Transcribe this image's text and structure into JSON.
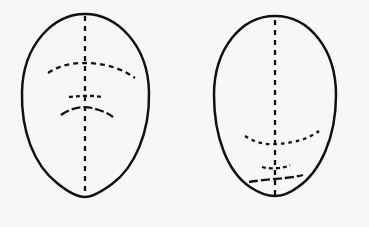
{
  "image": {
    "title": "Two head outlines with dashed facial proportion guidelines",
    "background_color": "#f7f7f6",
    "ink_color": "#111111",
    "width": 369,
    "height": 227
  },
  "figures": [
    {
      "id": "left-head",
      "label": "Left head outline",
      "description": "Egg-shaped head, wider at the cranium and tapering to a narrow rounded chin, with dashed vertical centerline and dashed brow, nose and mouth guidelines placed high on the face",
      "outline": {
        "center_x": 85,
        "center_y": 105,
        "left_x": 21,
        "right_x": 150,
        "top_y": 14,
        "bottom_y": 197,
        "path": "M 85 14 C 116 14 148 44 149 92 C 150 133 134 168 112 184 C 101 192 92 197 85 197 C 78 197 68 192 57 183 C 34 165 21 131 22 92 C 23 44 54 14 85 14 Z"
      },
      "guides": [
        {
          "name": "midline",
          "type": "vertical-centerline",
          "path": "M 85 16 L 85 196",
          "dash": "5 5"
        },
        {
          "name": "brow-line",
          "type": "brow-arc",
          "path": "M 48 73 C 62 64 74 63 85 63 C 100 63 118 66 135 78",
          "dash": "5 4"
        },
        {
          "name": "nose-line",
          "type": "nose-bar",
          "path": "M 69 97 C 76 96 94 95 101 97",
          "dash": "4 3"
        },
        {
          "name": "mouth-line",
          "type": "mouth-arc",
          "path": "M 61 115 C 72 107 84 106 92 108 C 100 110 108 113 113 117",
          "dash": "9 3"
        }
      ]
    },
    {
      "id": "right-head",
      "label": "Right head outline",
      "description": "Rounder, fuller oval head with a broad rounded chin; dashed vertical centerline runs the full height and the brow, nose and mouth guidelines sit far lower, crowded toward the chin",
      "outline": {
        "center_x": 275,
        "center_y": 106,
        "left_x": 213,
        "right_x": 337,
        "top_y": 16,
        "bottom_y": 196,
        "path": "M 275 16 C 309 16 336 49 336 95 C 336 138 320 172 298 187 C 290 193 282 196 275 196 C 268 196 259 193 250 187 C 228 172 214 138 214 95 C 214 49 241 16 275 16 Z"
      },
      "guides": [
        {
          "name": "midline",
          "type": "vertical-centerline",
          "path": "M 275 20 L 275 195",
          "dash": "5 5"
        },
        {
          "name": "brow-line",
          "type": "brow-arc",
          "path": "M 245 136 C 256 143 266 145 277 144 C 295 143 310 138 319 131",
          "dash": "3.5 4"
        },
        {
          "name": "nose-line",
          "type": "nose-bar",
          "path": "M 262 167 C 268 169 284 169 290 165",
          "dash": "4 3"
        },
        {
          "name": "mouth-line",
          "type": "mouth-arc",
          "path": "M 249 182 C 261 180 276 179 285 178 C 293 177 300 176 303 175",
          "dash": "9 3"
        }
      ]
    }
  ]
}
